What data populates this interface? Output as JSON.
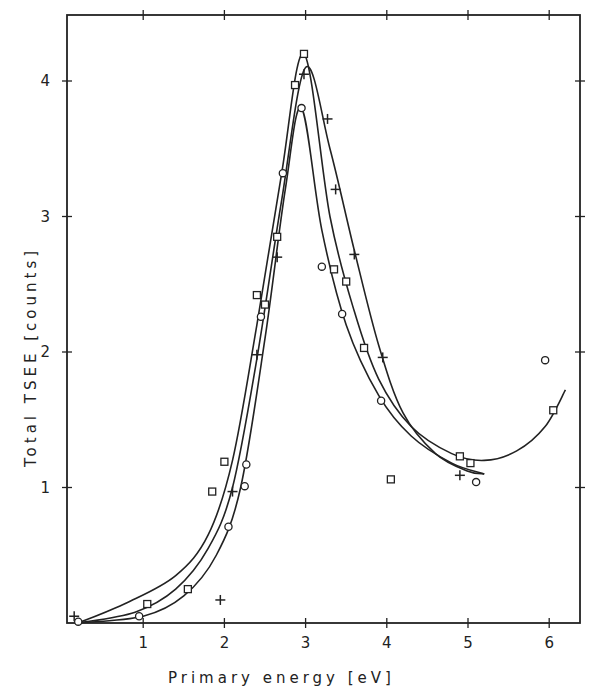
{
  "chart_data": {
    "type": "scatter",
    "title": "",
    "xlabel": "Primary energy  [eV]",
    "ylabel": "Total  TSEE   [counts]",
    "xlim": [
      0,
      6.3
    ],
    "ylim": [
      0,
      4.4
    ],
    "x_ticks": [
      1,
      2,
      3,
      4,
      5,
      6
    ],
    "y_ticks": [
      1,
      2,
      3,
      4
    ],
    "grid": false,
    "legend": "none",
    "series": [
      {
        "name": "squares",
        "marker": "square",
        "points": [
          [
            1.05,
            0.14
          ],
          [
            1.55,
            0.25
          ],
          [
            1.85,
            0.97
          ],
          [
            2.0,
            1.19
          ],
          [
            2.4,
            2.42
          ],
          [
            2.5,
            2.35
          ],
          [
            2.65,
            2.85
          ],
          [
            2.87,
            3.97
          ],
          [
            2.98,
            4.2
          ],
          [
            3.35,
            2.61
          ],
          [
            3.5,
            2.52
          ],
          [
            3.72,
            2.03
          ],
          [
            4.05,
            1.06
          ],
          [
            4.9,
            1.23
          ],
          [
            5.03,
            1.18
          ],
          [
            6.05,
            1.57
          ]
        ],
        "curve": [
          [
            0.2,
            0.0
          ],
          [
            0.8,
            0.15
          ],
          [
            1.4,
            0.35
          ],
          [
            1.8,
            0.65
          ],
          [
            2.1,
            1.2
          ],
          [
            2.4,
            2.2
          ],
          [
            2.7,
            3.3
          ],
          [
            2.98,
            4.2
          ],
          [
            3.3,
            3.0
          ],
          [
            3.6,
            2.3
          ],
          [
            3.9,
            1.8
          ],
          [
            4.3,
            1.45
          ],
          [
            4.8,
            1.25
          ],
          [
            5.2,
            1.2
          ],
          [
            5.6,
            1.27
          ],
          [
            5.95,
            1.45
          ],
          [
            6.2,
            1.72
          ]
        ]
      },
      {
        "name": "plus",
        "marker": "plus",
        "points": [
          [
            0.15,
            0.05
          ],
          [
            1.95,
            0.17
          ],
          [
            2.1,
            0.97
          ],
          [
            2.4,
            1.98
          ],
          [
            2.65,
            2.7
          ],
          [
            2.98,
            4.05
          ],
          [
            3.27,
            3.72
          ],
          [
            3.37,
            3.2
          ],
          [
            3.6,
            2.72
          ],
          [
            3.95,
            1.96
          ],
          [
            4.9,
            1.09
          ]
        ],
        "curve": [
          [
            0.2,
            0.0
          ],
          [
            0.9,
            0.08
          ],
          [
            1.4,
            0.25
          ],
          [
            1.8,
            0.55
          ],
          [
            2.1,
            1.0
          ],
          [
            2.4,
            1.95
          ],
          [
            2.7,
            3.1
          ],
          [
            3.0,
            4.1
          ],
          [
            3.3,
            3.5
          ],
          [
            3.6,
            2.75
          ],
          [
            3.9,
            2.05
          ],
          [
            4.2,
            1.55
          ],
          [
            4.6,
            1.25
          ],
          [
            5.0,
            1.12
          ],
          [
            5.2,
            1.1
          ]
        ]
      },
      {
        "name": "circles",
        "marker": "circle",
        "points": [
          [
            0.2,
            0.01
          ],
          [
            0.95,
            0.05
          ],
          [
            2.05,
            0.71
          ],
          [
            2.25,
            1.01
          ],
          [
            2.27,
            1.17
          ],
          [
            2.45,
            2.26
          ],
          [
            2.72,
            3.32
          ],
          [
            2.95,
            3.8
          ],
          [
            3.2,
            2.63
          ],
          [
            3.45,
            2.28
          ],
          [
            3.93,
            1.64
          ],
          [
            5.1,
            1.04
          ],
          [
            5.95,
            1.94
          ]
        ],
        "curve": [
          [
            0.2,
            0.0
          ],
          [
            1.0,
            0.05
          ],
          [
            1.5,
            0.2
          ],
          [
            1.9,
            0.5
          ],
          [
            2.2,
            1.0
          ],
          [
            2.5,
            2.1
          ],
          [
            2.75,
            3.2
          ],
          [
            2.95,
            3.8
          ],
          [
            3.2,
            2.9
          ],
          [
            3.5,
            2.2
          ],
          [
            3.9,
            1.68
          ],
          [
            4.3,
            1.38
          ],
          [
            4.8,
            1.18
          ],
          [
            5.2,
            1.1
          ]
        ]
      }
    ]
  },
  "axes": {
    "x_title": "Primary energy  [eV]",
    "y_title": "Total  TSEE   [counts]",
    "x_tick_labels": [
      "1",
      "2",
      "3",
      "4",
      "5",
      "6"
    ],
    "y_tick_labels": [
      "1",
      "2",
      "3",
      "4"
    ]
  }
}
